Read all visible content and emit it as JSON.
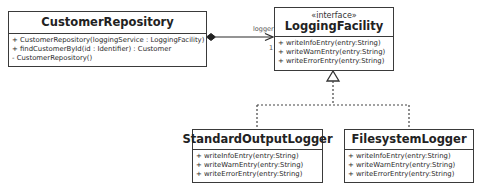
{
  "diagram": {
    "type": "UML class diagram",
    "classes": [
      {
        "id": "customer_repository",
        "name": "CustomerRepository",
        "stereotype": null,
        "operations": [
          "+ CustomerRepository(loggingService : LoggingFacility)",
          "+ findCustomerById(id : Identifier) : Customer",
          "- CustomerRepository()"
        ]
      },
      {
        "id": "logging_facility",
        "name": "LoggingFacility",
        "stereotype": "«interface»",
        "operations": [
          "+ writeInfoEntry(entry:String)",
          "+ writeWarnEntry(entry:String)",
          "+ writeErrorEntry(entry:String)"
        ]
      },
      {
        "id": "standard_output_logger",
        "name": "StandardOutputLogger",
        "stereotype": null,
        "operations": [
          "+ writeInfoEntry(entry:String)",
          "+ writeWarnEntry(entry:String)",
          "+ writeErrorEntry(entry:String)"
        ]
      },
      {
        "id": "filesystem_logger",
        "name": "FilesystemLogger",
        "stereotype": null,
        "operations": [
          "+ writeInfoEntry(entry:String)",
          "+ writeWarnEntry(entry:String)",
          "+ writeErrorEntry(entry:String)"
        ]
      }
    ],
    "relationships": [
      {
        "type": "composition",
        "from": "CustomerRepository",
        "to": "LoggingFacility",
        "role": "logger",
        "multiplicity": "1"
      },
      {
        "type": "realization",
        "from": "StandardOutputLogger",
        "to": "LoggingFacility"
      },
      {
        "type": "realization",
        "from": "FilesystemLogger",
        "to": "LoggingFacility"
      }
    ],
    "colors": {
      "line": "#3a3a3a",
      "background": "#ffffff",
      "text": "#222222"
    }
  }
}
